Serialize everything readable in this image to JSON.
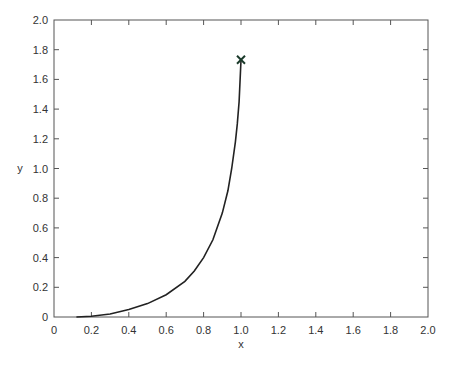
{
  "chart_data": {
    "type": "line",
    "title": "",
    "xlabel": "x",
    "ylabel": "y",
    "xlim": [
      0,
      2.0
    ],
    "ylim": [
      0,
      2.0
    ],
    "grid": false,
    "legend": null,
    "x_ticks": [
      "0",
      "0.2",
      "0.4",
      "0.6",
      "0.8",
      "1.0",
      "1.2",
      "1.4",
      "1.6",
      "1.8",
      "2.0"
    ],
    "y_ticks": [
      "0",
      "0.2",
      "0.4",
      "0.6",
      "0.8",
      "1.0",
      "1.2",
      "1.4",
      "1.6",
      "1.8",
      "2.0"
    ],
    "series": [
      {
        "name": "curve",
        "color": "#222222",
        "x": [
          0.12,
          0.2,
          0.3,
          0.4,
          0.5,
          0.6,
          0.7,
          0.75,
          0.8,
          0.85,
          0.9,
          0.93,
          0.95,
          0.97,
          0.98,
          0.99,
          1.0
        ],
        "y": [
          0.0,
          0.005,
          0.02,
          0.05,
          0.09,
          0.15,
          0.24,
          0.31,
          0.4,
          0.52,
          0.7,
          0.85,
          1.0,
          1.18,
          1.3,
          1.45,
          1.73
        ]
      }
    ],
    "annotations": [
      {
        "type": "marker",
        "symbol": "x",
        "x": 1.0,
        "y": 1.732,
        "color": "#1a3a2a"
      }
    ]
  }
}
